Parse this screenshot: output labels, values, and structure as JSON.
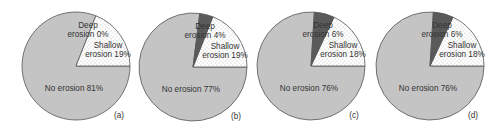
{
  "chart_data": [
    {
      "type": "pie",
      "panel_label": "(a)",
      "categories": [
        "No erosion",
        "Shallow erosion",
        "Deep erosion"
      ],
      "values": [
        81,
        19,
        0
      ],
      "labels": [
        "No erosion 81%",
        "Shallow erosion 19%",
        "Deep erosion 0%"
      ],
      "colors": [
        "#c4c4c4",
        "#ffffff",
        "#5a5a5a"
      ]
    },
    {
      "type": "pie",
      "panel_label": "(b)",
      "categories": [
        "No erosion",
        "Shallow erosion",
        "Deep erosion"
      ],
      "values": [
        77,
        19,
        4
      ],
      "labels": [
        "No erosion 77%",
        "Shallow erosion 19%",
        "Deep erosion 4%"
      ],
      "colors": [
        "#c4c4c4",
        "#ffffff",
        "#5a5a5a"
      ]
    },
    {
      "type": "pie",
      "panel_label": "(c)",
      "categories": [
        "No erosion",
        "Shallow erosion",
        "Deep erosion"
      ],
      "values": [
        76,
        18,
        6
      ],
      "labels": [
        "No erosion 76%",
        "Shallow erosion 18%",
        "Deep erosion 6%"
      ],
      "colors": [
        "#c4c4c4",
        "#ffffff",
        "#5a5a5a"
      ]
    },
    {
      "type": "pie",
      "panel_label": "(d)",
      "categories": [
        "No erosion",
        "Shallow erosion",
        "Deep erosion"
      ],
      "values": [
        76,
        18,
        6
      ],
      "labels": [
        "No erosion 76%",
        "Shallow erosion 18%",
        "Deep erosion 6%"
      ],
      "colors": [
        "#c4c4c4",
        "#ffffff",
        "#5a5a5a"
      ]
    }
  ],
  "layout": {
    "centers": [
      [
        76,
        66
      ],
      [
        193,
        67
      ],
      [
        311,
        66
      ],
      [
        430,
        66
      ]
    ],
    "radius": 54
  }
}
